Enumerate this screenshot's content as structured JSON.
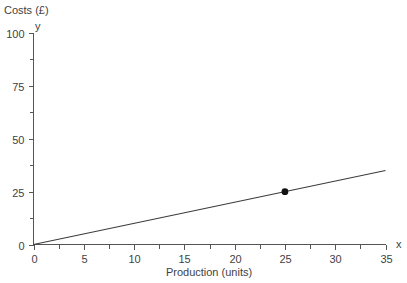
{
  "chart_data": {
    "type": "line",
    "title": "",
    "ylabel": "Costs (£)",
    "xlabel": "Production (units)",
    "x_axis_letter": "x",
    "y_axis_letter": "y",
    "xlim": [
      0,
      35
    ],
    "ylim": [
      0,
      100
    ],
    "grid": false,
    "legend": false,
    "x_ticks": [
      0,
      5,
      10,
      15,
      20,
      25,
      30,
      35
    ],
    "x_tick_labels": [
      "0",
      "5",
      "10",
      "15",
      "20",
      "25",
      "30",
      "35"
    ],
    "x_minor_step": 2.5,
    "y_ticks": [
      0,
      25,
      50,
      75,
      100
    ],
    "y_tick_labels": [
      "0",
      "25",
      "50",
      "75",
      "100"
    ],
    "y_minor_step": 12.5,
    "series": [
      {
        "name": "total cost",
        "line_color": "#3c3c3c",
        "x": [
          0,
          35
        ],
        "values": [
          0,
          35
        ]
      }
    ],
    "points": [
      {
        "x": 25,
        "y": 25,
        "color": "#111111"
      }
    ]
  }
}
